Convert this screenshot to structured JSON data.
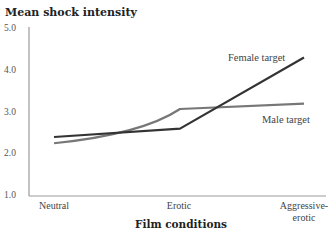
{
  "chart_data": {
    "type": "line",
    "title": "",
    "ylabel": "Mean shock intensity",
    "xlabel": "Film conditions",
    "categories": [
      "Neutral",
      "Erotic",
      "Aggressive-erotic"
    ],
    "category_labels": [
      {
        "line1": "Neutral",
        "line2": ""
      },
      {
        "line1": "Erotic",
        "line2": ""
      },
      {
        "line1": "Aggressive-",
        "line2": "erotic"
      }
    ],
    "ylim": [
      1.0,
      5.0
    ],
    "yticks": [
      "5.0",
      "4.0",
      "3.0",
      "2.0",
      "1.0"
    ],
    "grid": false,
    "legend": "inline labels near line ends",
    "series": [
      {
        "name": "Female target",
        "values": [
          2.4,
          2.6,
          4.3
        ],
        "color": "#333333"
      },
      {
        "name": "Male target",
        "values": [
          2.25,
          3.07,
          3.2
        ],
        "color": "#777777"
      }
    ]
  },
  "colors": {
    "axis": "#9a9a9a",
    "female_line": "#333333",
    "male_line": "#777777",
    "text": "#333333"
  }
}
